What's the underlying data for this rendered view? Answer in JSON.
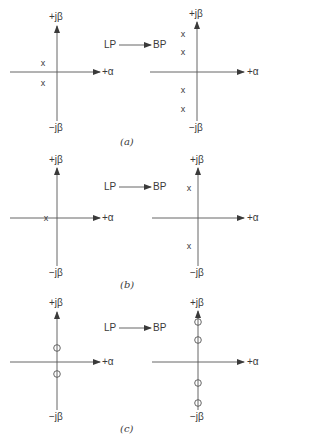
{
  "axis_labels": {
    "pos_imag": "+jβ",
    "neg_imag": "−jβ",
    "pos_real": "+α"
  },
  "transform": {
    "from": "LP",
    "to": "BP"
  },
  "panels": [
    {
      "caption": "(a)",
      "left": {
        "marker": "x",
        "points": [
          [
            -1,
            1
          ],
          [
            -1,
            -1
          ]
        ]
      },
      "right": {
        "marker": "x",
        "points": [
          [
            -1,
            2
          ],
          [
            -1,
            1
          ],
          [
            -1,
            -1
          ],
          [
            -1,
            -2
          ]
        ]
      }
    },
    {
      "caption": "(b)",
      "left": {
        "marker": "x",
        "points": [
          [
            -1,
            0
          ]
        ]
      },
      "right": {
        "marker": "x",
        "points": [
          [
            -1,
            1
          ],
          [
            -1,
            -1
          ]
        ]
      }
    },
    {
      "caption": "(c)",
      "left": {
        "marker": "o",
        "points": [
          [
            0,
            1
          ],
          [
            0,
            -1
          ]
        ]
      },
      "right": {
        "marker": "o",
        "points": [
          [
            0,
            2
          ],
          [
            0,
            1
          ],
          [
            0,
            -1
          ],
          [
            0,
            -2
          ]
        ]
      }
    }
  ],
  "colors": {
    "ink": "#3a3a3a",
    "background": "#ffffff"
  }
}
